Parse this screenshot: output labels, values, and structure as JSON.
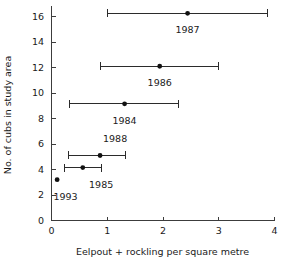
{
  "chart_data": {
    "type": "scatter",
    "title": "",
    "xlabel": "Eelpout + rockling per square metre",
    "ylabel": "No. of cubs in study area",
    "xlim": [
      0,
      4
    ],
    "ylim": [
      0,
      16.8
    ],
    "xticks": [
      0,
      1,
      2,
      3,
      4
    ],
    "xtick_labels": [
      "0",
      "1",
      "2",
      "3",
      "4"
    ],
    "yticks": [
      0,
      2,
      4,
      6,
      8,
      10,
      12,
      14,
      16
    ],
    "ytick_labels": [
      "0",
      "2",
      "4",
      "6",
      "8",
      "10",
      "12",
      "14",
      "16"
    ],
    "grid": false,
    "legend": false,
    "error_bars": "x",
    "points": [
      {
        "label": "1987",
        "x": 2.45,
        "y": 16.25,
        "x_low": 1.0,
        "x_high": 3.88,
        "label_dx": 0.0,
        "label_dy": -1.35
      },
      {
        "label": "1986",
        "x": 1.95,
        "y": 12.1,
        "x_low": 0.88,
        "x_high": 3.0,
        "label_dx": 0.0,
        "label_dy": -1.35
      },
      {
        "label": "1984",
        "x": 1.32,
        "y": 9.15,
        "x_low": 0.32,
        "x_high": 2.27,
        "label_dx": 0.0,
        "label_dy": -1.35
      },
      {
        "label": "1988",
        "x": 0.88,
        "y": 5.1,
        "x_low": 0.3,
        "x_high": 1.33,
        "label_dx": 0.27,
        "label_dy": 1.25
      },
      {
        "label": "1985",
        "x": 0.57,
        "y": 4.15,
        "x_low": 0.24,
        "x_high": 0.9,
        "label_dx": 0.33,
        "label_dy": -1.35
      },
      {
        "label": "1993",
        "x": 0.11,
        "y": 3.2,
        "x_low": 0.11,
        "x_high": 0.11,
        "label_dx": 0.15,
        "label_dy": -1.35
      }
    ]
  },
  "geometry": {
    "x0_px": 51,
    "x4_px": 274,
    "y0_px": 220,
    "y16_px": 16,
    "tick_len": 4,
    "cap_half": 4,
    "marker_r": 2.4,
    "xlabel_y_px": 255,
    "ylabel_x_px": 11,
    "ylabel_y_px": 115,
    "xtick_label_y_px": 234,
    "ytick_label_dx_px": -7
  }
}
